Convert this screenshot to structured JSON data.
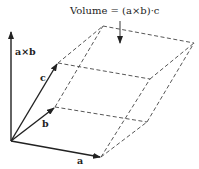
{
  "diagram": {
    "title": "Volume = (a×b)·c",
    "labels": {
      "a": "a",
      "b": "b",
      "c": "c",
      "axb": "a×b"
    },
    "colors": {
      "stroke": "#222222",
      "dashed": "#444444",
      "background": "#ffffff"
    },
    "points": {
      "origin": [
        11,
        141
      ],
      "a": [
        101,
        157
      ],
      "b": [
        55,
        107
      ],
      "c": [
        58,
        63
      ],
      "axb": [
        12,
        32
      ],
      "a_plus_b": [
        147,
        122
      ],
      "a_plus_c": [
        150,
        79
      ],
      "b_plus_c": [
        103,
        26
      ],
      "a_plus_b_plus_c": [
        194,
        43
      ]
    }
  }
}
